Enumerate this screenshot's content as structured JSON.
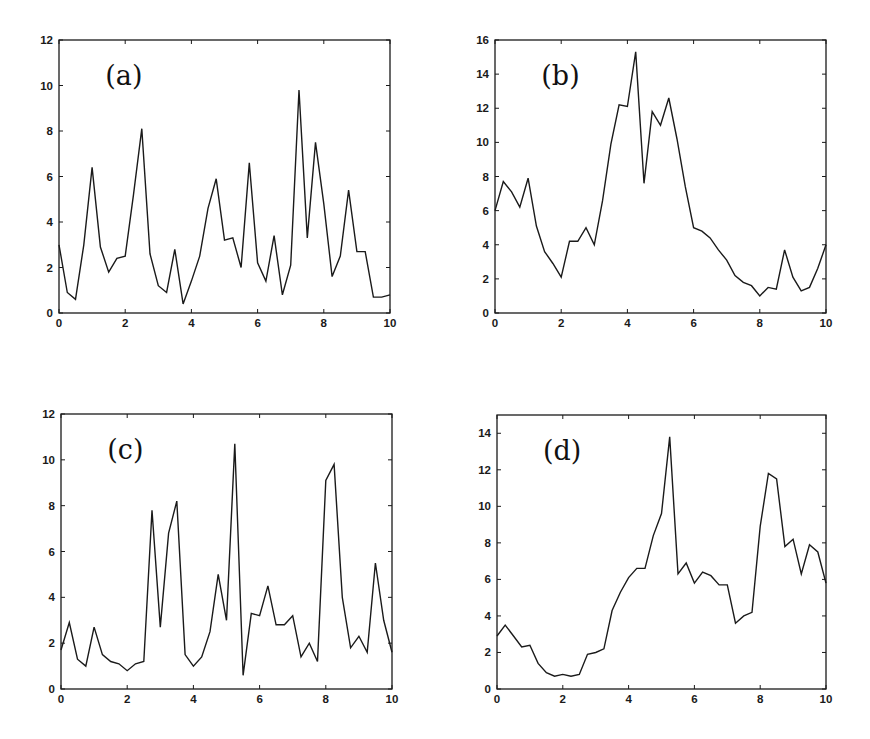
{
  "figure": {
    "background": "#ffffff",
    "line_color": "#1a1a1a"
  },
  "chart_data": [
    {
      "type": "line",
      "panel_label": "(a)",
      "title": "",
      "xlabel": "",
      "ylabel": "",
      "xlim": [
        0,
        10
      ],
      "ylim": [
        0,
        12
      ],
      "xticks": [
        0,
        2,
        4,
        6,
        8,
        10
      ],
      "yticks": [
        0,
        2,
        4,
        6,
        8,
        10,
        12
      ],
      "grid": false,
      "frame": {
        "left": 59,
        "top": 40,
        "right": 390,
        "bottom": 313
      },
      "x": [
        0,
        0.25,
        0.5,
        0.75,
        1,
        1.25,
        1.5,
        1.75,
        2,
        2.25,
        2.5,
        2.75,
        3,
        3.25,
        3.5,
        3.75,
        4,
        4.25,
        4.5,
        4.75,
        5,
        5.25,
        5.5,
        5.75,
        6,
        6.25,
        6.5,
        6.75,
        7,
        7.25,
        7.5,
        7.75,
        8,
        8.25,
        8.5,
        8.75,
        9,
        9.25,
        9.5,
        9.75,
        10
      ],
      "values": [
        3.0,
        0.9,
        0.6,
        3.0,
        6.4,
        2.9,
        1.8,
        2.4,
        2.5,
        5.2,
        8.1,
        2.6,
        1.2,
        0.9,
        2.8,
        0.4,
        1.4,
        2.5,
        4.6,
        5.9,
        3.2,
        3.3,
        2.0,
        6.6,
        2.2,
        1.4,
        3.4,
        0.8,
        2.1,
        9.8,
        3.3,
        7.5,
        4.8,
        1.6,
        2.5,
        5.4,
        2.7,
        2.7,
        0.7,
        0.7,
        0.8
      ]
    },
    {
      "type": "line",
      "panel_label": "(b)",
      "title": "",
      "xlabel": "",
      "ylabel": "",
      "xlim": [
        0,
        10
      ],
      "ylim": [
        0,
        16
      ],
      "xticks": [
        0,
        2,
        4,
        6,
        8,
        10
      ],
      "yticks": [
        0,
        2,
        4,
        6,
        8,
        10,
        12,
        14,
        16
      ],
      "grid": false,
      "frame": {
        "left": 495,
        "top": 40,
        "right": 826,
        "bottom": 313
      },
      "x": [
        0,
        0.25,
        0.5,
        0.75,
        1,
        1.25,
        1.5,
        1.75,
        2,
        2.25,
        2.5,
        2.75,
        3,
        3.25,
        3.5,
        3.75,
        4,
        4.25,
        4.5,
        4.75,
        5,
        5.25,
        5.5,
        5.75,
        6,
        6.25,
        6.5,
        6.75,
        7,
        7.25,
        7.5,
        7.75,
        8,
        8.25,
        8.5,
        8.75,
        9,
        9.25,
        9.5,
        9.75,
        10
      ],
      "values": [
        6.0,
        7.7,
        7.1,
        6.2,
        7.9,
        5.1,
        3.6,
        2.9,
        2.1,
        4.2,
        4.2,
        5.0,
        4.0,
        6.6,
        9.9,
        12.2,
        12.1,
        15.3,
        7.6,
        11.8,
        11.0,
        12.6,
        10.2,
        7.4,
        5.0,
        4.8,
        4.4,
        3.7,
        3.1,
        2.2,
        1.8,
        1.6,
        1.0,
        1.5,
        1.4,
        3.7,
        2.1,
        1.3,
        1.5,
        2.6,
        4.0
      ]
    },
    {
      "type": "line",
      "panel_label": "(c)",
      "title": "",
      "xlabel": "",
      "ylabel": "",
      "xlim": [
        0,
        10
      ],
      "ylim": [
        0,
        12
      ],
      "xticks": [
        0,
        2,
        4,
        6,
        8,
        10
      ],
      "yticks": [
        0,
        2,
        4,
        6,
        8,
        10,
        12
      ],
      "grid": false,
      "frame": {
        "left": 61,
        "top": 414,
        "right": 392,
        "bottom": 689
      },
      "x": [
        0,
        0.25,
        0.5,
        0.75,
        1,
        1.25,
        1.5,
        1.75,
        2,
        2.25,
        2.5,
        2.75,
        3,
        3.25,
        3.5,
        3.75,
        4,
        4.25,
        4.5,
        4.75,
        5,
        5.25,
        5.5,
        5.75,
        6,
        6.25,
        6.5,
        6.75,
        7,
        7.25,
        7.5,
        7.75,
        8,
        8.25,
        8.5,
        8.75,
        9,
        9.25,
        9.5,
        9.75,
        10
      ],
      "values": [
        1.7,
        2.9,
        1.3,
        1.0,
        2.7,
        1.5,
        1.2,
        1.1,
        0.8,
        1.1,
        1.2,
        7.8,
        2.7,
        6.8,
        8.2,
        1.5,
        1.0,
        1.4,
        2.5,
        5.0,
        3.0,
        10.7,
        0.6,
        3.3,
        3.2,
        4.5,
        2.8,
        2.8,
        3.2,
        1.4,
        2.0,
        1.2,
        9.1,
        9.8,
        4.0,
        1.8,
        2.3,
        1.6,
        5.5,
        3.0,
        1.6
      ]
    },
    {
      "type": "line",
      "panel_label": "(d)",
      "title": "",
      "xlabel": "",
      "ylabel": "",
      "xlim": [
        0,
        10
      ],
      "ylim": [
        0,
        15
      ],
      "xticks": [
        0,
        2,
        4,
        6,
        8,
        10
      ],
      "yticks": [
        0,
        2,
        4,
        6,
        8,
        10,
        12,
        14
      ],
      "grid": false,
      "frame": {
        "left": 497,
        "top": 415,
        "right": 826,
        "bottom": 689
      },
      "x": [
        0,
        0.25,
        0.5,
        0.75,
        1,
        1.25,
        1.5,
        1.75,
        2,
        2.25,
        2.5,
        2.75,
        3,
        3.25,
        3.5,
        3.75,
        4,
        4.25,
        4.5,
        4.75,
        5,
        5.25,
        5.5,
        5.75,
        6,
        6.25,
        6.5,
        6.75,
        7,
        7.25,
        7.5,
        7.75,
        8,
        8.25,
        8.5,
        8.75,
        9,
        9.25,
        9.5,
        9.75,
        10
      ],
      "values": [
        2.9,
        3.5,
        2.9,
        2.3,
        2.4,
        1.4,
        0.9,
        0.7,
        0.8,
        0.7,
        0.8,
        1.9,
        2.0,
        2.2,
        4.3,
        5.3,
        6.1,
        6.6,
        6.6,
        8.4,
        9.6,
        13.8,
        6.3,
        6.9,
        5.8,
        6.4,
        6.2,
        5.7,
        5.7,
        3.6,
        4.0,
        4.2,
        8.9,
        11.8,
        11.5,
        7.8,
        8.2,
        6.3,
        7.9,
        7.5,
        5.8
      ]
    }
  ]
}
